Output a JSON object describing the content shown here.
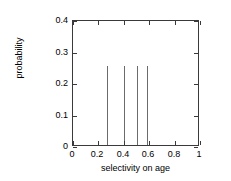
{
  "chart_data": {
    "type": "bar",
    "title": "",
    "xlabel": "selectivity on age",
    "ylabel": "probability",
    "xlim": [
      0,
      1
    ],
    "ylim": [
      0,
      0.4
    ],
    "grid": false,
    "legend": null,
    "style": "impulses",
    "xticks": [
      "0",
      "0.2",
      "0.4",
      "0.6",
      "0.8",
      "1"
    ],
    "xtick_values": [
      0,
      0.2,
      0.4,
      0.6,
      0.8,
      1
    ],
    "yticks": [
      "0",
      "0.1",
      "0.2",
      "0.3",
      "0.4"
    ],
    "ytick_values": [
      0,
      0.1,
      0.2,
      0.3,
      0.4
    ],
    "x": [
      0.27,
      0.4,
      0.5,
      0.58
    ],
    "values": [
      0.25,
      0.25,
      0.25,
      0.25
    ],
    "points": [
      {
        "x": 0.27,
        "y": 0.25
      },
      {
        "x": 0.4,
        "y": 0.25
      },
      {
        "x": 0.5,
        "y": 0.25
      },
      {
        "x": 0.58,
        "y": 0.25
      }
    ],
    "series": [
      {
        "name": "probability",
        "x": [
          0.27,
          0.4,
          0.5,
          0.58
        ],
        "values": [
          0.25,
          0.25,
          0.25,
          0.25
        ]
      }
    ],
    "colors": {
      "line": "#6b6b6b",
      "axis": "#3a3a3a",
      "background": "#ffffff",
      "text": "#000000"
    }
  }
}
